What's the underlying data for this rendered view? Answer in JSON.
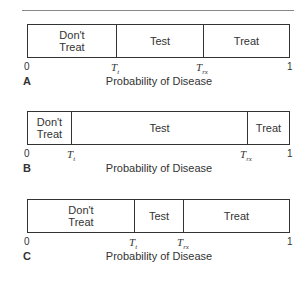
{
  "panels": [
    {
      "letter": "A",
      "xlabel": "Probability of Disease",
      "axis_start": "0",
      "axis_end": "1",
      "threshold_test": {
        "symbol": "T",
        "subscript": "t",
        "position": 0.33
      },
      "threshold_treat": {
        "symbol": "T",
        "subscript": "rx",
        "position": 0.67
      },
      "segments": [
        {
          "label": "Don't Treat",
          "lines": [
            "Don't",
            "Treat"
          ],
          "from": 0.0,
          "to": 0.33
        },
        {
          "label": "Test",
          "lines": [
            "Test"
          ],
          "from": 0.33,
          "to": 0.67
        },
        {
          "label": "Treat",
          "lines": [
            "Treat"
          ],
          "from": 0.67,
          "to": 1.0
        }
      ]
    },
    {
      "letter": "B",
      "xlabel": "Probability of Disease",
      "axis_start": "0",
      "axis_end": "1",
      "threshold_test": {
        "symbol": "T",
        "subscript": "t",
        "position": 0.16
      },
      "threshold_treat": {
        "symbol": "T",
        "subscript": "rx",
        "position": 0.83
      },
      "segments": [
        {
          "label": "Don't Treat",
          "lines": [
            "Don't",
            "Treat"
          ],
          "from": 0.0,
          "to": 0.16
        },
        {
          "label": "Test",
          "lines": [
            "Test"
          ],
          "from": 0.16,
          "to": 0.83
        },
        {
          "label": "Treat",
          "lines": [
            "Treat"
          ],
          "from": 0.83,
          "to": 1.0
        }
      ]
    },
    {
      "letter": "C",
      "xlabel": "Probability of Disease",
      "axis_start": "0",
      "axis_end": "1",
      "threshold_test": {
        "symbol": "T",
        "subscript": "t",
        "position": 0.4
      },
      "threshold_treat": {
        "symbol": "T",
        "subscript": "rx",
        "position": 0.59
      },
      "segments": [
        {
          "label": "Don't Treat",
          "lines": [
            "Don't",
            "Treat"
          ],
          "from": 0.0,
          "to": 0.4
        },
        {
          "label": "Test",
          "lines": [
            "Test"
          ],
          "from": 0.4,
          "to": 0.59
        },
        {
          "label": "Treat",
          "lines": [
            "Treat"
          ],
          "from": 0.59,
          "to": 1.0
        }
      ]
    }
  ]
}
